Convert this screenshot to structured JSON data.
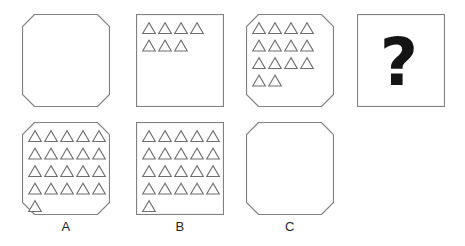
{
  "puzzle": {
    "colors": {
      "background": "#ffffff",
      "box_border": "#818181",
      "triangle_fill": "#ffffff",
      "triangle_stroke": "#6e6e6e",
      "question_mark": "#141414",
      "label_text": "#1f1f1f"
    },
    "sequence": [
      {
        "name": "step-1",
        "shape": "octagon",
        "rows": [],
        "triangle_count": 0
      },
      {
        "name": "step-2",
        "shape": "square",
        "rows": [
          4,
          3
        ],
        "triangle_count": 7
      },
      {
        "name": "step-3",
        "shape": "octagon",
        "rows": [
          4,
          4,
          4,
          2
        ],
        "triangle_count": 14
      },
      {
        "name": "step-4",
        "shape": "square",
        "rows": [],
        "content": "question",
        "symbol": "?"
      }
    ],
    "options": [
      {
        "label": "A",
        "shape": "octagon",
        "rows": [
          5,
          5,
          5,
          5,
          1
        ],
        "triangle_count": 21
      },
      {
        "label": "B",
        "shape": "square",
        "rows": [
          5,
          5,
          5,
          5,
          1
        ],
        "triangle_count": 21
      },
      {
        "label": "C",
        "shape": "octagon",
        "rows": [],
        "triangle_count": 0
      }
    ]
  }
}
